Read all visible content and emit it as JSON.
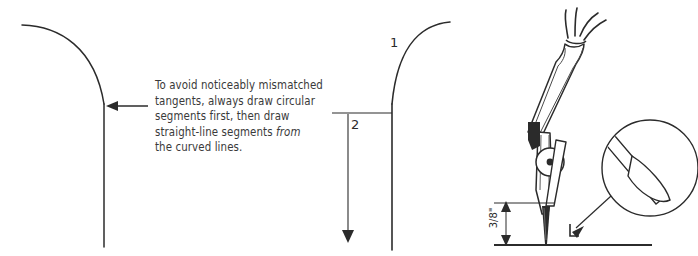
{
  "figure": {
    "kind": "technical-illustration",
    "background_color": "#ffffff",
    "ink_color": "#2b2b2b",
    "text_color": "#3a3a3a"
  },
  "panels": {
    "left": {
      "name": "tangent-junction-diagram",
      "description": "quarter-round curve flowing into a vertical straight line",
      "arrow": "arrow-pointing-left-at-tangent-point"
    },
    "caption": {
      "line1": "To avoid noticeably mismatched",
      "line2": "tangents, always draw circular",
      "line3": "segments first, then draw",
      "line4_a": "straight-line segments ",
      "line4_em": "from",
      "line5": "the curved lines."
    },
    "middle": {
      "name": "drawing-order-diagram",
      "step_one_label": "1",
      "step_two_label": "2",
      "step_one_meaning": "draw the curve first",
      "step_two_meaning": "then draw the straight line downward"
    },
    "right": {
      "name": "compass-needle-detail",
      "dimension_label": "3/8\"",
      "magnifier_caption": "",
      "parts": {
        "handle": "compass-fork-head",
        "pivot": "compass-pivot-joint",
        "needle": "compass-needle-point",
        "baseline": "drawing-surface-line",
        "detail_circle": "magnified-needle-tip"
      }
    }
  }
}
